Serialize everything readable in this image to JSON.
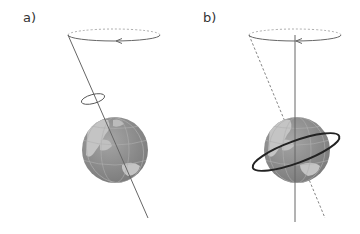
{
  "panels": [
    {
      "label": "a)",
      "description": "Precession of Earth's tilted rotation axis tracing a cone; small ring shows Earth's spin",
      "elements": [
        "precession-circle",
        "rotation-axis",
        "spin-ring",
        "globe"
      ]
    },
    {
      "label": "b)",
      "description": "Vertical reference axis with dashed tilted axis; thick ring around the globe",
      "elements": [
        "precession-circle",
        "vertical-axis",
        "dashed-tilted-axis",
        "equatorial-ring",
        "globe"
      ]
    }
  ],
  "colors": {
    "line": "#666666",
    "dashed": "#888888",
    "globe_ocean": "#8c8c8c",
    "globe_land": "#bdbdbd",
    "ring": "#222222",
    "text": "#333333"
  }
}
